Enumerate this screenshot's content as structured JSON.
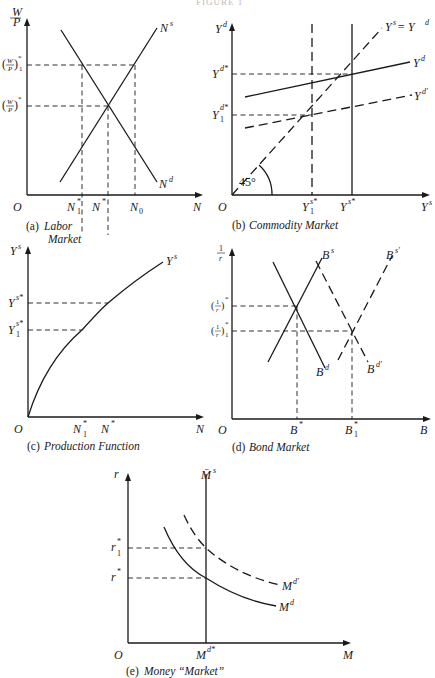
{
  "header": {
    "fragment": "FIGURE 1"
  },
  "panels": {
    "a": {
      "caption_letter": "(a)",
      "caption_line1": "Labor",
      "caption_line2": "Market",
      "y_axis_label_num": "W",
      "y_axis_label_den": "P",
      "x_axis_label": "N",
      "origin": "O",
      "y_ticks": [
        {
          "label": "(W/P)",
          "sup": "*",
          "sub": "1"
        },
        {
          "label": "(W/P)",
          "sup": "*",
          "sub": ""
        }
      ],
      "x_ticks": [
        {
          "label": "N",
          "sup": "*",
          "sub": "1"
        },
        {
          "label": "N",
          "sup": "*",
          "sub": ""
        },
        {
          "label": "N",
          "sup": "",
          "sub": "0"
        }
      ],
      "curves": {
        "supply": {
          "label": "N",
          "sup": "s"
        },
        "demand": {
          "label": "N",
          "sup": "d"
        }
      }
    },
    "b": {
      "caption_letter": "(b)",
      "caption_text": "Commodity Market",
      "y_axis_label": "Y",
      "y_axis_sup": "d",
      "x_axis_label": "Y",
      "x_axis_sup": "s",
      "origin": "O",
      "angle_label": "45°",
      "y_ticks": [
        {
          "label": "Y",
          "sup": "d*",
          "sub": ""
        },
        {
          "label": "Y",
          "sup": "d*",
          "sub": "1"
        }
      ],
      "x_ticks": [
        {
          "label": "Y",
          "sup": "s*",
          "sub": "1"
        },
        {
          "label": "Y",
          "sup": "s*",
          "sub": ""
        }
      ],
      "curves": {
        "equality": {
          "text": "Y",
          "sup1": "s",
          "eq": " = Y",
          "sup2": "d"
        },
        "demand": {
          "label": "Y",
          "sup": "d"
        },
        "demand_shifted": {
          "label": "Y",
          "sup": "d′"
        }
      }
    },
    "c": {
      "caption_letter": "(c)",
      "caption_text": "Production Function",
      "y_axis_label": "Y",
      "y_axis_sup": "s",
      "x_axis_label": "N",
      "origin": "O",
      "y_ticks": [
        {
          "label": "Y",
          "sup": "s*",
          "sub": ""
        },
        {
          "label": "Y",
          "sup": "s*",
          "sub": "1"
        }
      ],
      "x_ticks": [
        {
          "label": "N",
          "sup": "*",
          "sub": "1"
        },
        {
          "label": "N",
          "sup": "*",
          "sub": ""
        }
      ],
      "curves": {
        "production": {
          "label": "Y",
          "sup": "s"
        }
      }
    },
    "d": {
      "caption_letter": "(d)",
      "caption_text": "Bond Market",
      "y_axis_label_num": "1",
      "y_axis_label_den": "r",
      "x_axis_label": "B",
      "origin": "O",
      "y_ticks": [
        {
          "label": "(1/r)",
          "sup": "*",
          "sub": ""
        },
        {
          "label": "(1/r)",
          "sup": "*",
          "sub": "1"
        }
      ],
      "x_ticks": [
        {
          "label": "B",
          "sup": "*",
          "sub": ""
        },
        {
          "label": "B",
          "sup": "*",
          "sub": "1"
        }
      ],
      "curves": {
        "supply": {
          "label": "B",
          "sup": "s"
        },
        "demand": {
          "label": "B",
          "sup": "d"
        },
        "supply_shifted": {
          "label": "B",
          "sup": "s′"
        },
        "demand_shifted": {
          "label": "B",
          "sup": "d′"
        }
      }
    },
    "e": {
      "caption_letter": "(e)",
      "caption_text": "Money “Market”",
      "y_axis_label": "r",
      "x_axis_label": "M",
      "origin": "O",
      "y_ticks": [
        {
          "label": "r",
          "sup": "*",
          "sub": "1"
        },
        {
          "label": "r",
          "sup": "*",
          "sub": ""
        }
      ],
      "x_ticks": [
        {
          "label": "M",
          "sup": "d*",
          "sub": ""
        }
      ],
      "curves": {
        "supply": {
          "label": "M̄",
          "sup": "s"
        },
        "demand": {
          "label": "M",
          "sup": "d"
        },
        "demand_shifted": {
          "label": "M",
          "sup": "d′"
        }
      }
    }
  }
}
